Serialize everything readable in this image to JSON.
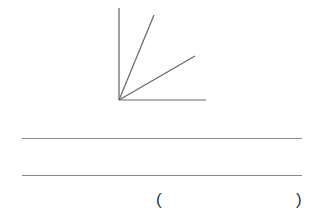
{
  "diagram": {
    "type": "angle-figure",
    "rays": [
      "vertical-side",
      "upper-ray",
      "lower-ray",
      "horizontal-side"
    ],
    "stroke_color": "#555555"
  },
  "answer_lines": {
    "count": 2
  },
  "answer_bracket": {
    "open": "(",
    "close": ")"
  },
  "colors": {
    "line": "#8a8a8a",
    "text": "#333333"
  }
}
